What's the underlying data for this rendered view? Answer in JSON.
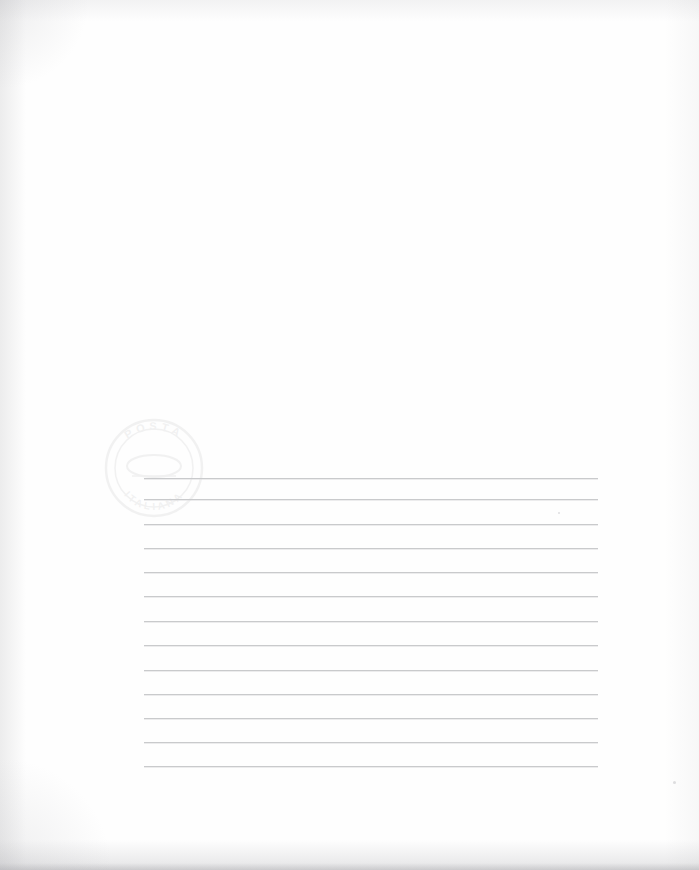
{
  "document": {
    "kind": "scanned-blank-ruled-sheet",
    "title": "Blank ruled correspondence sheet",
    "page_width": 699,
    "page_height": 870,
    "paper_color": "#fefefe",
    "rule_color": "#c9cacc",
    "description": "Scan of an otherwise blank sheet of writing paper bearing thirteen horizontal ruled lines in the lower half and a very faint circular ink stamp at the left."
  },
  "ruled_area": {
    "label": "Ruled writing area",
    "line_count": 13,
    "left_x": 144,
    "right_x": 598,
    "line_width": 454,
    "lines": [
      {
        "index": 1,
        "y": 478
      },
      {
        "index": 2,
        "y": 499
      },
      {
        "index": 3,
        "y": 524
      },
      {
        "index": 4,
        "y": 548
      },
      {
        "index": 5,
        "y": 572
      },
      {
        "index": 6,
        "y": 596
      },
      {
        "index": 7,
        "y": 621
      },
      {
        "index": 8,
        "y": 645
      },
      {
        "index": 9,
        "y": 670
      },
      {
        "index": 10,
        "y": 694
      },
      {
        "index": 11,
        "y": 718
      },
      {
        "index": 12,
        "y": 742
      },
      {
        "index": 13,
        "y": 766
      }
    ]
  },
  "stamp": {
    "name": "postal-stamp",
    "shape": "circular",
    "center_x": 154,
    "center_y": 468,
    "radius": 51,
    "color": "#b9b9bd",
    "opacity": 0.085,
    "top_text": "POSTA",
    "bottom_text": "ITALIANA",
    "legible": "barely"
  },
  "specks": [
    {
      "name": "speck-right-edge",
      "x": 673,
      "y": 781,
      "size": 3
    },
    {
      "name": "speck-mid-right",
      "x": 558,
      "y": 512,
      "size": 2
    }
  ],
  "edges": {
    "left_shadow": "#bebec0",
    "right_shadow": "#c8c8ca",
    "top_shadow": "#c4c4c6",
    "bottom_shadow": "#b2b2b6"
  }
}
